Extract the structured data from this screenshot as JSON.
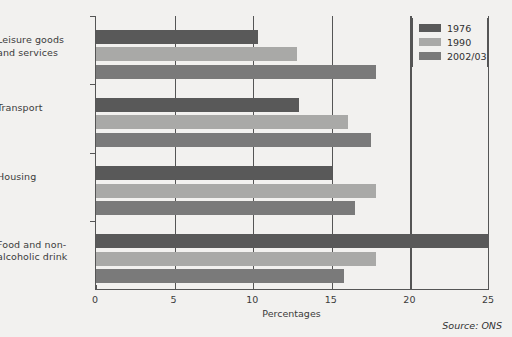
{
  "chart_data": {
    "type": "bar",
    "orientation": "horizontal",
    "title": "",
    "subtitle": "",
    "xlabel": "Percentages",
    "ylabel": "",
    "xlim": [
      0,
      25
    ],
    "xticks": [
      0,
      5,
      10,
      15,
      20,
      25
    ],
    "xticklabels": [
      "0",
      "5",
      "10",
      "15",
      "20",
      "25"
    ],
    "grid": "vertical",
    "categories": [
      "Leisure goods and services",
      "Transport",
      "Housing",
      "Food and non-alcoholic drink"
    ],
    "series": [
      {
        "name": "1976",
        "color": "#595959",
        "values": [
          10.3,
          12.9,
          15.0,
          25.0
        ]
      },
      {
        "name": "1990",
        "color": "#a9a9a7",
        "values": [
          12.8,
          16.0,
          17.8,
          17.8
        ]
      },
      {
        "name": "2002/03",
        "color": "#7a7a7a",
        "values": [
          17.8,
          17.5,
          16.5,
          15.8
        ]
      }
    ],
    "legend": {
      "position": "top-right",
      "entries": [
        {
          "label": "1976",
          "color": "#595959"
        },
        {
          "label": "1990",
          "color": "#a9a9a7"
        },
        {
          "label": "2002/03",
          "color": "#7a7a7a"
        }
      ]
    },
    "annotations": [
      {
        "name": "source-note",
        "text": "Source: ONS",
        "position": "bottom-right"
      }
    ],
    "colors": {
      "background": "#f2f1ef",
      "axis": "#555555",
      "text": "#3b3b3b"
    }
  }
}
